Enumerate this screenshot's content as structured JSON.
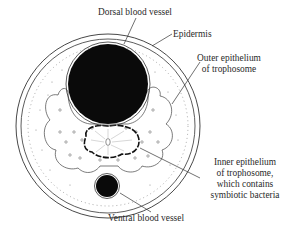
{
  "diagram": {
    "type": "cross-section illustration",
    "colors": {
      "background": "#ffffff",
      "line": "#333333",
      "fill_vessel": "#0a0a0a",
      "label_text": "#2a2a2a"
    },
    "labels": {
      "dorsal_vessel": "Dorsal blood vessel",
      "epidermis": "Epidermis",
      "outer_epithelium": [
        "Outer epithelium",
        "of trophosome"
      ],
      "inner_epithelium": [
        "Inner epithelium",
        "of trophosome,",
        "which contains",
        "symbiotic bacteria"
      ],
      "ventral_vessel": "Ventral blood vessel"
    }
  }
}
